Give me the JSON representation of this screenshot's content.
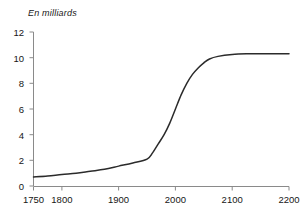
{
  "chart_data": {
    "type": "line",
    "title": "En milliards",
    "xlabel": "",
    "ylabel": "",
    "xlim": [
      1750,
      2200
    ],
    "ylim": [
      0,
      12
    ],
    "grid": false,
    "legend": "none",
    "line_color": "#2b2b2b",
    "axis_color": "#8a8a8a",
    "x_ticks": [
      1750,
      1800,
      1900,
      2000,
      2100,
      2200
    ],
    "x_tick_labels": [
      "1750",
      "1800",
      "1900",
      "2000",
      "2100",
      "2200"
    ],
    "y_ticks": [
      0,
      2,
      4,
      6,
      8,
      10,
      12
    ],
    "y_tick_labels": [
      "0",
      "2",
      "4",
      "6",
      "8",
      "10",
      "12"
    ],
    "series": [
      {
        "name": "Population mondiale",
        "x": [
          1750,
          1775,
          1800,
          1825,
          1850,
          1875,
          1900,
          1925,
          1950,
          1960,
          1970,
          1980,
          1990,
          2000,
          2010,
          2020,
          2030,
          2040,
          2050,
          2060,
          2075,
          2100,
          2125,
          2150,
          2175,
          2200
        ],
        "values": [
          0.7,
          0.78,
          0.9,
          1.0,
          1.15,
          1.3,
          1.55,
          1.8,
          2.1,
          2.6,
          3.3,
          4.0,
          4.9,
          6.0,
          7.1,
          8.0,
          8.7,
          9.2,
          9.6,
          9.9,
          10.1,
          10.25,
          10.3,
          10.3,
          10.3,
          10.3
        ]
      }
    ]
  }
}
